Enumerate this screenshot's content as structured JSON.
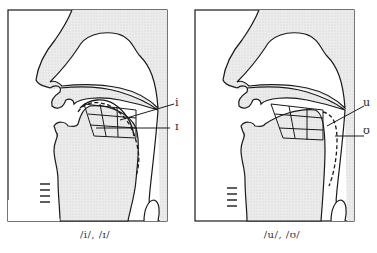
{
  "figure": {
    "panels": [
      {
        "caption": "/i/, /ɪ/",
        "labels": [
          "i",
          "ɪ"
        ]
      },
      {
        "caption": "/u/, /ʊ/",
        "labels": [
          "u",
          "ʊ"
        ]
      }
    ],
    "colors": {
      "tissue_fill": "#e4e4e4",
      "stroke": "#1a1a1a",
      "background": "#ffffff"
    }
  }
}
